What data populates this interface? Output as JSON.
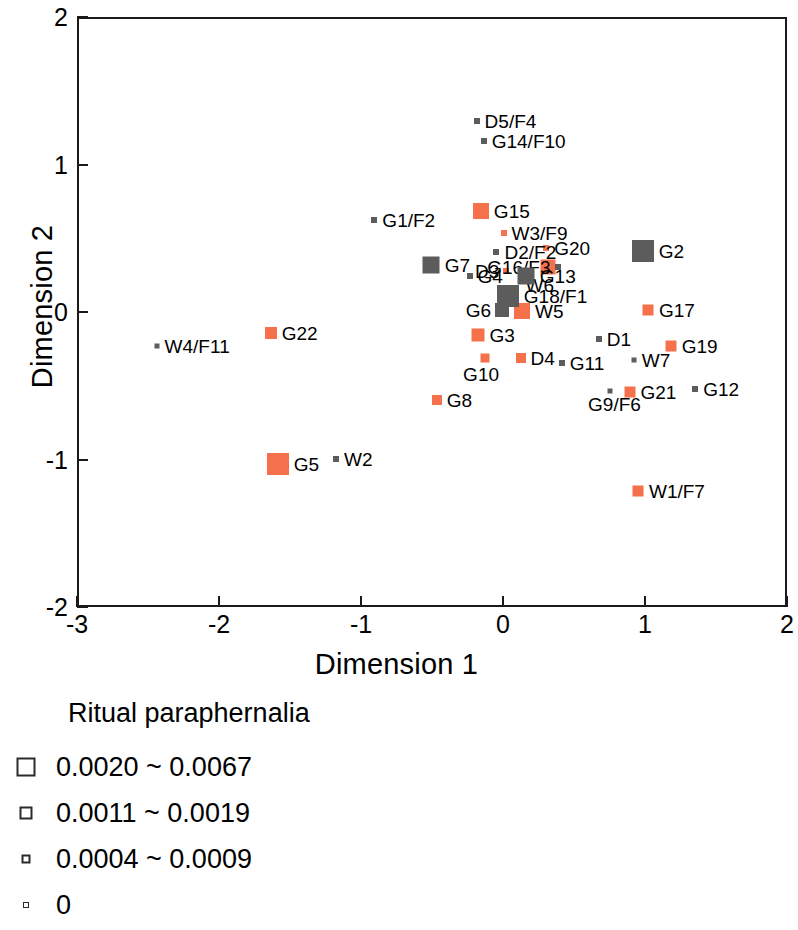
{
  "chart_data": {
    "type": "scatter",
    "title": "",
    "xlabel": "Dimension 1",
    "ylabel": "Dimension 2",
    "xlim": [
      -3,
      2
    ],
    "ylim": [
      -2,
      2
    ],
    "xticks": [
      -3,
      -2,
      -1,
      0,
      1,
      2
    ],
    "yticks": [
      2,
      1,
      0,
      -1,
      -2
    ],
    "xtick_labels": [
      "-3",
      "-2",
      "-1",
      "0",
      "1",
      "2"
    ],
    "ytick_labels": [
      "2",
      "1",
      "0",
      "-1",
      "-2"
    ],
    "grid": false,
    "legend_position": "below-plot",
    "marker_shape": "square",
    "series": [
      {
        "name": "orange-group",
        "color": "#F4714B",
        "points": [
          {
            "label": "G15",
            "x": -0.17,
            "y": 0.7,
            "size": 16,
            "label_pos": "right"
          },
          {
            "label": "W3/F9",
            "x": -0.01,
            "y": 0.55,
            "size": 6,
            "label_pos": "right"
          },
          {
            "label": "G20",
            "x": 0.29,
            "y": 0.45,
            "size": 6,
            "label_pos": "right"
          },
          {
            "label": "D3",
            "x": 0.01,
            "y": 0.29,
            "size": 6,
            "label_pos": "left"
          },
          {
            "label": "W6",
            "x": 0.3,
            "y": 0.32,
            "size": 15,
            "label_pos": "below"
          },
          {
            "label": "W5",
            "x": 0.12,
            "y": 0.02,
            "size": 16,
            "label_pos": "right"
          },
          {
            "label": "G3",
            "x": -0.19,
            "y": -0.14,
            "size": 13,
            "label_pos": "right"
          },
          {
            "label": "G10",
            "x": -0.14,
            "y": -0.3,
            "size": 9,
            "label_pos": "below"
          },
          {
            "label": "D4",
            "x": 0.11,
            "y": -0.3,
            "size": 10,
            "label_pos": "right"
          },
          {
            "label": "G8",
            "x": -0.48,
            "y": -0.58,
            "size": 10,
            "label_pos": "right"
          },
          {
            "label": "G22",
            "x": -1.65,
            "y": -0.13,
            "size": 12,
            "label_pos": "right"
          },
          {
            "label": "G5",
            "x": -1.6,
            "y": -1.02,
            "size": 22,
            "label_pos": "right"
          },
          {
            "label": "G17",
            "x": 1.01,
            "y": 0.03,
            "size": 11,
            "label_pos": "right"
          },
          {
            "label": "G19",
            "x": 1.17,
            "y": -0.22,
            "size": 11,
            "label_pos": "right"
          },
          {
            "label": "G21",
            "x": 0.88,
            "y": -0.53,
            "size": 11,
            "label_pos": "right"
          },
          {
            "label": "W1/F7",
            "x": 0.94,
            "y": -1.2,
            "size": 11,
            "label_pos": "right"
          }
        ]
      },
      {
        "name": "gray-group",
        "color": "#5C5C5C",
        "points": [
          {
            "label": "D5/F4",
            "x": -0.2,
            "y": 1.31,
            "size": 6,
            "label_pos": "right"
          },
          {
            "label": "G14/F10",
            "x": -0.15,
            "y": 1.17,
            "size": 6,
            "label_pos": "right"
          },
          {
            "label": "G1/F2",
            "x": -0.92,
            "y": 0.64,
            "size": 6,
            "label_pos": "right"
          },
          {
            "label": "D2/F2",
            "x": -0.06,
            "y": 0.42,
            "size": 6,
            "label_pos": "right"
          },
          {
            "label": "G16/F3",
            "x": 0.37,
            "y": 0.32,
            "size": 6,
            "label_pos": "left"
          },
          {
            "label": "G2",
            "x": 0.97,
            "y": 0.43,
            "size": 22,
            "label_pos": "right"
          },
          {
            "label": "G7",
            "x": -0.52,
            "y": 0.33,
            "size": 17,
            "label_pos": "right"
          },
          {
            "label": "G4",
            "x": -0.25,
            "y": 0.26,
            "size": 6,
            "label_pos": "right"
          },
          {
            "label": "G13",
            "x": 0.15,
            "y": 0.26,
            "size": 17,
            "label_pos": "right"
          },
          {
            "label": "G18/F1",
            "x": 0.02,
            "y": 0.12,
            "size": 22,
            "label_pos": "right"
          },
          {
            "label": "G6",
            "x": -0.02,
            "y": 0.03,
            "size": 14,
            "label_pos": "left"
          },
          {
            "label": "D1",
            "x": 0.66,
            "y": -0.17,
            "size": 6,
            "label_pos": "right"
          },
          {
            "label": "G11",
            "x": 0.4,
            "y": -0.33,
            "size": 6,
            "label_pos": "right"
          },
          {
            "label": "W7",
            "x": 0.91,
            "y": -0.31,
            "size": 5,
            "label_pos": "right"
          },
          {
            "label": "G9/F6",
            "x": 0.74,
            "y": -0.52,
            "size": 5,
            "label_pos": "below"
          },
          {
            "label": "G12",
            "x": 1.34,
            "y": -0.51,
            "size": 6,
            "label_pos": "right"
          },
          {
            "label": "W4/F11",
            "x": -2.45,
            "y": -0.22,
            "size": 5,
            "label_pos": "right"
          },
          {
            "label": "W2",
            "x": -1.19,
            "y": -0.98,
            "size": 6,
            "label_pos": "right"
          }
        ]
      }
    ]
  },
  "legend": {
    "title": "Ritual paraphernalia",
    "items": [
      {
        "label": "0.0020 ~ 0.0067",
        "swatch_size": 19
      },
      {
        "label": "0.0011 ~ 0.0019",
        "swatch_size": 13
      },
      {
        "label": "0.0004 ~ 0.0009",
        "swatch_size": 9
      },
      {
        "label": "0",
        "swatch_size": 6
      }
    ]
  }
}
